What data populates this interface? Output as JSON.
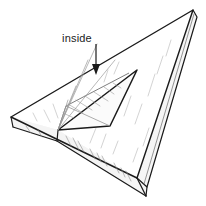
{
  "figure": {
    "style": "black and white technical line drawing with pencil hatching",
    "background_color": "#ffffff",
    "line_color": "#1a1a1a",
    "hatch_color": "#9a9a9a",
    "edge_shade_color": "#d8d8d8"
  },
  "annotations": [
    {
      "name": "inside-label",
      "text": "inside",
      "x": 62,
      "y": 40,
      "arrow": {
        "name": "inside-arrow",
        "from_x": 96,
        "from_y": 44,
        "to_x": 96,
        "to_y": 74,
        "head": "solid-triangle-down"
      }
    }
  ],
  "geometry": {
    "outer_top_face": {
      "name": "board-top-face",
      "points": "11,117 193,10 137,178"
    },
    "outer_vertices": [
      {
        "name": "left-apex",
        "x": 11,
        "y": 117
      },
      {
        "name": "top-right-apex",
        "x": 193,
        "y": 10
      },
      {
        "name": "bottom-apex",
        "x": 137,
        "y": 178
      }
    ],
    "board_thickness_px": 11,
    "inner_cutout": {
      "name": "triangular-cutout",
      "points": "58,130 137,70 110,126"
    },
    "inner_vertices": [
      {
        "name": "cutout-left-vertex",
        "x": 58,
        "y": 130
      },
      {
        "name": "cutout-top-vertex",
        "x": 137,
        "y": 70
      },
      {
        "name": "cutout-bottom-vertex",
        "x": 110,
        "y": 126
      }
    ]
  }
}
